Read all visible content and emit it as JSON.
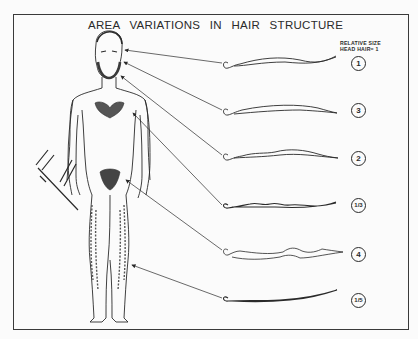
{
  "title": "AREA VARIATIONS IN HAIR STRUCTURE",
  "size_header": {
    "line1": "RELATIVE SIZE",
    "line2": "HEAD HAIR= 1"
  },
  "hairs": [
    {
      "area": "head",
      "relative_size": "1"
    },
    {
      "area": "eyebrow",
      "relative_size": "3"
    },
    {
      "area": "beard",
      "relative_size": "2"
    },
    {
      "area": "chest",
      "relative_size": "1/3"
    },
    {
      "area": "pubic",
      "relative_size": "4"
    },
    {
      "area": "leg",
      "relative_size": "1/5"
    }
  ],
  "colors": {
    "ink": "#2a2a2a",
    "paper": "#fbfbfb"
  }
}
